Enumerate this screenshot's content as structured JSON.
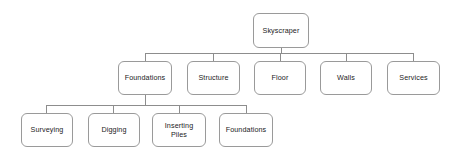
{
  "diagram": {
    "type": "tree",
    "style": {
      "background": "#ffffff",
      "node_fill": "#ffffff",
      "node_border": "#9a9a9a",
      "connector": "#8d8d8d",
      "text": "#1c1c1c"
    },
    "levels": [
      {
        "name": "level-1",
        "nodes": [
          {
            "id": "skyscraper",
            "label": "Skyscraper"
          }
        ]
      },
      {
        "name": "level-2",
        "nodes": [
          {
            "id": "foundations",
            "label": "Foundations"
          },
          {
            "id": "structure",
            "label": "Structure"
          },
          {
            "id": "floor",
            "label": "Floor"
          },
          {
            "id": "walls",
            "label": "Walls"
          },
          {
            "id": "services",
            "label": "Services"
          }
        ]
      },
      {
        "name": "level-3",
        "nodes": [
          {
            "id": "surveying",
            "label": "Surveying"
          },
          {
            "id": "digging",
            "label": "Digging"
          },
          {
            "id": "inserting-piles",
            "label": "Inserting\nPiles"
          },
          {
            "id": "foundations-sub",
            "label": "Foundations"
          }
        ]
      }
    ],
    "edges": [
      {
        "from": "skyscraper",
        "to": "foundations"
      },
      {
        "from": "skyscraper",
        "to": "structure"
      },
      {
        "from": "skyscraper",
        "to": "floor"
      },
      {
        "from": "skyscraper",
        "to": "walls"
      },
      {
        "from": "skyscraper",
        "to": "services"
      },
      {
        "from": "foundations",
        "to": "surveying"
      },
      {
        "from": "foundations",
        "to": "digging"
      },
      {
        "from": "foundations",
        "to": "inserting-piles"
      },
      {
        "from": "foundations",
        "to": "foundations-sub"
      }
    ]
  }
}
